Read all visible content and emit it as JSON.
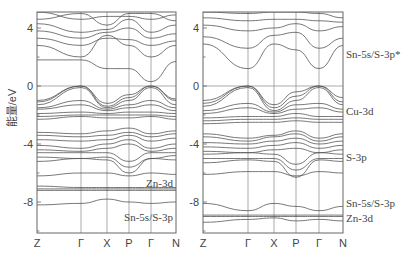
{
  "chart_data": [
    {
      "type": "line",
      "title": "",
      "panel": "left",
      "xlabel": "",
      "ylabel": "能量/eV",
      "ylim": [
        -10.2,
        5.1
      ],
      "yticks": [
        4,
        0,
        -4,
        -8
      ],
      "kpoints": [
        "Z",
        "Γ",
        "X",
        "P",
        "Γ",
        "N"
      ],
      "fermi_level": 0,
      "grid": "vertical at high-symmetry points",
      "annotations": [
        {
          "text": "Zn-3d",
          "energy": -6.7
        },
        {
          "text": "Sn-5s/S-3p",
          "energy": -9.0
        }
      ],
      "series": [
        {
          "name": "cb1",
          "values": [
            1.8,
            1.8,
            1.2,
            1.2,
            0.3,
            1.7
          ],
          "shape": "dip_at_gamma"
        },
        {
          "name": "cb2",
          "values": [
            2.8,
            2.0,
            3.5,
            2.8,
            2.0,
            2.8
          ]
        },
        {
          "name": "cb3",
          "values": [
            3.3,
            2.8,
            3.3,
            3.2,
            2.8,
            3.1
          ]
        },
        {
          "name": "cb4",
          "values": [
            3.8,
            3.3,
            3.7,
            4.0,
            3.3,
            3.6
          ]
        },
        {
          "name": "cb5",
          "values": [
            4.3,
            3.7,
            3.9,
            4.6,
            3.7,
            4.2
          ]
        },
        {
          "name": "cb6",
          "values": [
            4.6,
            5.0,
            4.2,
            5.0,
            5.0,
            4.5
          ]
        },
        {
          "name": "cb7",
          "values": [
            5.1,
            4.6,
            4.8,
            4.8,
            4.6,
            4.9
          ]
        },
        {
          "name": "vb1",
          "values": [
            -1.0,
            0.0,
            -1.2,
            -0.6,
            0.0,
            -0.9
          ]
        },
        {
          "name": "vb2",
          "values": [
            -1.1,
            0.0,
            -1.4,
            -0.8,
            0.0,
            -1.0
          ]
        },
        {
          "name": "vb3",
          "values": [
            -1.3,
            -0.1,
            -1.5,
            -1.0,
            -0.1,
            -1.3
          ]
        },
        {
          "name": "vb4",
          "values": [
            -1.5,
            -1.0,
            -1.6,
            -1.3,
            -1.0,
            -1.5
          ]
        },
        {
          "name": "vb5",
          "values": [
            -1.6,
            -1.3,
            -1.7,
            -1.5,
            -1.3,
            -1.7
          ]
        },
        {
          "name": "vb6",
          "values": [
            -1.9,
            -1.8,
            -1.9,
            -1.8,
            -1.8,
            -1.9
          ]
        },
        {
          "name": "vb7",
          "values": [
            -2.1,
            -2.0,
            -2.0,
            -2.0,
            -2.0,
            -2.1
          ]
        },
        {
          "name": "vb8",
          "values": [
            -2.3,
            -2.1,
            -2.2,
            -2.2,
            -2.1,
            -2.3
          ]
        },
        {
          "name": "vb9",
          "values": [
            -3.2,
            -3.3,
            -3.1,
            -2.9,
            -3.3,
            -3.1
          ]
        },
        {
          "name": "vb10",
          "values": [
            -3.4,
            -3.5,
            -3.4,
            -3.2,
            -3.5,
            -3.3
          ]
        },
        {
          "name": "vb11",
          "values": [
            -3.7,
            -3.8,
            -3.7,
            -3.4,
            -3.8,
            -3.6
          ]
        },
        {
          "name": "vb12",
          "values": [
            -4.1,
            -4.3,
            -4.0,
            -3.7,
            -4.3,
            -4.0
          ]
        },
        {
          "name": "vb13",
          "values": [
            -4.4,
            -4.5,
            -4.3,
            -4.0,
            -4.5,
            -4.3
          ]
        },
        {
          "name": "vb14",
          "values": [
            -4.6,
            -4.6,
            -4.6,
            -5.2,
            -4.6,
            -4.6
          ]
        },
        {
          "name": "vb15",
          "values": [
            -4.9,
            -5.0,
            -4.9,
            -5.6,
            -5.0,
            -4.8
          ]
        },
        {
          "name": "vb16",
          "values": [
            -5.2,
            -5.0,
            -5.1,
            -6.0,
            -5.0,
            -5.1
          ]
        },
        {
          "name": "vb17",
          "values": [
            -6.2,
            -6.0,
            -6.0,
            -6.2,
            -6.0,
            -6.1
          ]
        },
        {
          "name": "zn3d_1",
          "values": [
            -6.9,
            -7.0,
            -7.0,
            -7.0,
            -7.0,
            -7.0
          ]
        },
        {
          "name": "zn3d_2",
          "values": [
            -7.1,
            -7.1,
            -7.1,
            -7.1,
            -7.1,
            -7.1
          ]
        },
        {
          "name": "zn3d_3",
          "values": [
            -7.2,
            -7.2,
            -7.2,
            -7.2,
            -7.2,
            -7.2
          ]
        },
        {
          "name": "s3s_1",
          "values": [
            -8.2,
            -8.1,
            -7.8,
            -8.0,
            -8.1,
            -8.0
          ]
        }
      ]
    },
    {
      "type": "line",
      "title": "",
      "panel": "right",
      "xlabel": "",
      "ylabel": "",
      "ylim": [
        -10.2,
        5.1
      ],
      "yticks": [
        4,
        0,
        -4,
        -8
      ],
      "kpoints": [
        "Z",
        "Γ",
        "X",
        "P",
        "Γ",
        "N"
      ],
      "fermi_level": 0,
      "grid": "vertical at high-symmetry points",
      "annotations": [
        {
          "text": "Sn-5s/S-3p*",
          "energy": 2.2
        },
        {
          "text": "Cu-3d",
          "energy": -1.7
        },
        {
          "text": "S-3p",
          "energy": -4.9
        },
        {
          "text": "Sn-5s/S-3p",
          "energy": -8.1
        },
        {
          "text": "Zn-3d",
          "energy": -9.1
        }
      ],
      "series": [
        {
          "name": "cb1",
          "values": [
            2.9,
            1.2,
            2.9,
            2.5,
            1.2,
            2.8
          ]
        },
        {
          "name": "cb2",
          "values": [
            3.4,
            2.6,
            3.5,
            3.7,
            2.6,
            3.3
          ]
        },
        {
          "name": "cb3",
          "values": [
            4.2,
            3.8,
            4.0,
            4.3,
            3.8,
            4.1
          ]
        },
        {
          "name": "cb4",
          "values": [
            4.7,
            4.5,
            4.6,
            4.6,
            4.5,
            4.4
          ]
        },
        {
          "name": "cb5",
          "values": [
            5.1,
            5.0,
            5.1,
            5.1,
            5.0,
            4.7
          ]
        },
        {
          "name": "vb1",
          "values": [
            -1.0,
            0.0,
            -1.3,
            -0.4,
            0.0,
            -0.8
          ]
        },
        {
          "name": "vb2",
          "values": [
            -1.2,
            0.0,
            -1.5,
            -0.7,
            0.0,
            -1.1
          ]
        },
        {
          "name": "vb3",
          "values": [
            -1.4,
            -0.1,
            -1.7,
            -1.0,
            -0.1,
            -1.3
          ]
        },
        {
          "name": "vb4",
          "values": [
            -1.7,
            -1.2,
            -1.8,
            -1.3,
            -1.2,
            -1.6
          ]
        },
        {
          "name": "vb5",
          "values": [
            -1.9,
            -1.5,
            -1.9,
            -1.6,
            -1.5,
            -1.8
          ]
        },
        {
          "name": "vb6",
          "values": [
            -2.2,
            -2.1,
            -2.1,
            -1.9,
            -2.1,
            -2.1
          ]
        },
        {
          "name": "vb7",
          "values": [
            -2.4,
            -2.3,
            -2.3,
            -2.2,
            -2.3,
            -2.3
          ]
        },
        {
          "name": "vb8",
          "values": [
            -2.6,
            -2.5,
            -2.5,
            -2.4,
            -2.5,
            -2.5
          ]
        },
        {
          "name": "vb9",
          "values": [
            -3.3,
            -3.6,
            -3.4,
            -3.1,
            -3.6,
            -3.3
          ]
        },
        {
          "name": "vb10",
          "values": [
            -3.5,
            -3.8,
            -3.5,
            -3.3,
            -3.8,
            -3.5
          ]
        },
        {
          "name": "vb11",
          "values": [
            -3.9,
            -4.0,
            -3.8,
            -3.6,
            -4.0,
            -3.8
          ]
        },
        {
          "name": "vb12",
          "values": [
            -4.2,
            -4.3,
            -4.1,
            -3.9,
            -4.3,
            -4.1
          ]
        },
        {
          "name": "vb13",
          "values": [
            -4.5,
            -4.6,
            -4.4,
            -4.3,
            -4.6,
            -4.4
          ]
        },
        {
          "name": "vb14",
          "values": [
            -4.7,
            -4.6,
            -4.7,
            -5.4,
            -4.6,
            -4.7
          ]
        },
        {
          "name": "vb15",
          "values": [
            -5.0,
            -5.0,
            -5.0,
            -5.8,
            -5.0,
            -5.0
          ]
        },
        {
          "name": "vb16",
          "values": [
            -5.3,
            -5.1,
            -5.2,
            -6.3,
            -5.1,
            -5.2
          ]
        },
        {
          "name": "vb17",
          "values": [
            -6.1,
            -5.9,
            -5.9,
            -6.2,
            -5.9,
            -6.0
          ]
        },
        {
          "name": "sn5s",
          "values": [
            -8.1,
            -8.6,
            -8.1,
            -8.3,
            -8.6,
            -8.3
          ]
        },
        {
          "name": "zn3d_1",
          "values": [
            -8.9,
            -8.9,
            -8.9,
            -8.9,
            -8.9,
            -8.9
          ]
        },
        {
          "name": "zn3d_2",
          "values": [
            -9.0,
            -9.0,
            -9.0,
            -9.0,
            -9.0,
            -9.0
          ]
        },
        {
          "name": "s3s_1",
          "values": [
            -9.4,
            -9.2,
            -9.1,
            -9.3,
            -9.2,
            -9.3
          ]
        }
      ]
    }
  ],
  "axes": {
    "ylabel": "能量/eV",
    "ytick_labels": [
      "4",
      "0",
      "-4",
      "-8"
    ],
    "kpoint_labels": [
      "Z",
      "Γ",
      "X",
      "P",
      "Γ",
      "N"
    ]
  },
  "style": {
    "line_color": "#555555",
    "frame_color": "#666666",
    "grid_color": "#888888",
    "text_color": "#444444"
  }
}
